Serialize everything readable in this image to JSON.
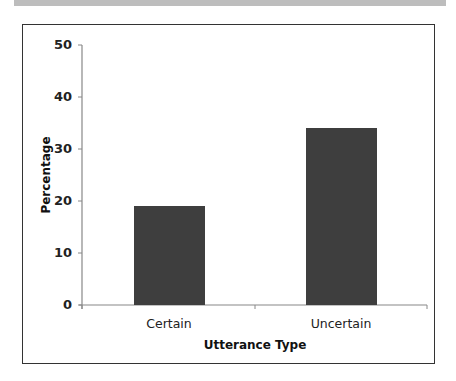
{
  "chart_data": {
    "type": "bar",
    "title": "",
    "xlabel": "Utterance Type",
    "ylabel": "Percentage",
    "categories": [
      "Certain",
      "Uncertain"
    ],
    "values": [
      19,
      34
    ],
    "ylim": [
      0,
      50
    ],
    "yticks": [
      0,
      10,
      20,
      30,
      40,
      50
    ],
    "grid": false,
    "legend": null,
    "bar_color": "#3e3e3e"
  },
  "labels": {
    "yticks": [
      "0",
      "10",
      "20",
      "30",
      "40",
      "50"
    ],
    "xticks": [
      "Certain",
      "Uncertain"
    ],
    "xlabel": "Utterance Type",
    "ylabel": "Percentage"
  }
}
